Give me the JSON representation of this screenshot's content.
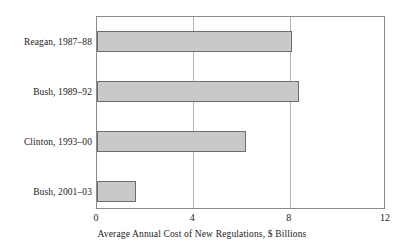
{
  "chart_data": {
    "type": "bar",
    "orientation": "horizontal",
    "title": "",
    "xlabel": "Average Annual Cost of New Regulations, $ Billions",
    "ylabel": "",
    "categories": [
      "Reagan, 1987–88",
      "Bush, 1989–92",
      "Clinton, 1993–00",
      "Bush, 2001–03"
    ],
    "values": [
      8.1,
      8.4,
      6.2,
      1.6
    ],
    "xlim": [
      0,
      12
    ],
    "xticks": [
      0,
      4,
      8,
      12
    ],
    "xtick_labels": [
      "0",
      "4",
      "8",
      "12"
    ],
    "grid": "vertical-at-xticks",
    "legend": "none",
    "bar_fill_color": "#c9c9c9",
    "bar_border_color": "#6e6e6e",
    "axis_color": "#8a8a8a",
    "gridline_color": "#b4b4b4",
    "background_color": "#ffffff"
  }
}
